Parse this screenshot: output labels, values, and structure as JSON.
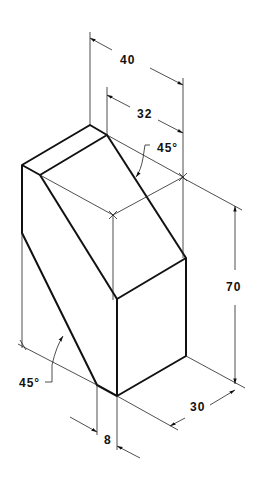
{
  "drawing": {
    "type": "isometric-technical-drawing",
    "dimensions": {
      "overall_depth": "40",
      "top_depth": "32",
      "height": "70",
      "width": "30",
      "offset": "8"
    },
    "angles": {
      "top_angle": "45°",
      "bottom_angle": "45°"
    },
    "colors": {
      "line": "#111111",
      "background": "#ffffff"
    }
  }
}
